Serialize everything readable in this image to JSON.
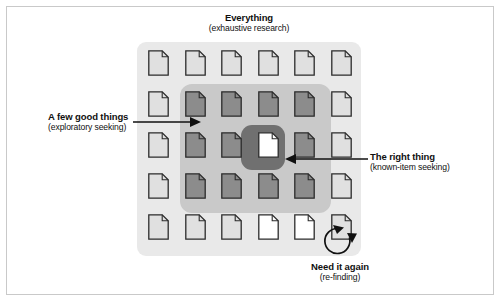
{
  "figure": {
    "background_color": "#ffffff",
    "border_color": "#c9c9c9"
  },
  "panels": {
    "outer": {
      "name": "everything-scope",
      "color": "#e9e9e9"
    },
    "middle": {
      "name": "a-few-good-things-scope",
      "color": "#c9c9c9"
    },
    "inner": {
      "name": "the-right-thing-scope",
      "color": "#707070"
    }
  },
  "labels": {
    "everything": {
      "title": "Everything",
      "sub": "(exhaustive research)"
    },
    "a_few_good_things": {
      "title": "A few good things",
      "sub": "(exploratory seeking)"
    },
    "the_right_thing": {
      "title": "The right thing",
      "sub": "(known-item seeking)"
    },
    "need_it_again": {
      "title": "Need it again",
      "sub": "(re-finding)"
    }
  },
  "grid": {
    "columns": 6,
    "rows": 5,
    "doc_fill_light": "#e0e0e0",
    "doc_fill_medium": "#8c8c8c",
    "doc_fill_white": "#ffffff",
    "doc_stroke": "#2b2b2b",
    "cells": [
      [
        "light",
        "light",
        "light",
        "light",
        "light",
        "light"
      ],
      [
        "light",
        "medium",
        "medium",
        "medium",
        "medium",
        "light"
      ],
      [
        "light",
        "medium",
        "medium",
        "white",
        "medium",
        "light"
      ],
      [
        "light",
        "medium",
        "medium",
        "medium",
        "medium",
        "light"
      ],
      [
        "light",
        "light",
        "light",
        "white",
        "white",
        "light"
      ]
    ]
  },
  "connectors": {
    "a_few_good_things_arrow": "arrow pointing right into middle panel",
    "the_right_thing_arrow": "arrow pointing left into center document",
    "need_it_again_arrow": "circular re-finding loop arrow"
  }
}
